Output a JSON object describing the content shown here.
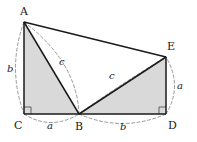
{
  "figure": {
    "kind": "geometry-diagram",
    "canvas": {
      "width": 197,
      "height": 142
    },
    "colors": {
      "background": "#ffffff",
      "stroke": "#1a1a1a",
      "shading": "#d9d9d9",
      "dashed": "#8c8c8c",
      "label": "#1a1a1a"
    }
  },
  "points": {
    "A": {
      "label": "A",
      "x": 24,
      "y": 22,
      "label_x": 20,
      "label_y": 6
    },
    "B": {
      "label": "B",
      "x": 79,
      "y": 114,
      "label_x": 75,
      "label_y": 121
    },
    "C": {
      "label": "C",
      "x": 24,
      "y": 114,
      "label_x": 15,
      "label_y": 120
    },
    "D": {
      "label": "D",
      "x": 166,
      "y": 114,
      "label_x": 168,
      "label_y": 120
    },
    "E": {
      "label": "E",
      "x": 166,
      "y": 57,
      "label_x": 168,
      "label_y": 41
    }
  },
  "solid_segments": [
    {
      "name": "segment-A-E",
      "from": "A",
      "to": "E"
    },
    {
      "name": "segment-A-C",
      "from": "A",
      "to": "C"
    },
    {
      "name": "segment-A-B",
      "from": "A",
      "to": "B"
    },
    {
      "name": "segment-B-E",
      "from": "B",
      "to": "E"
    },
    {
      "name": "segment-E-D",
      "from": "E",
      "to": "D"
    },
    {
      "name": "segment-C-D",
      "from": "C",
      "to": "D"
    }
  ],
  "shaded_triangles": [
    {
      "name": "triangle-A-C-B",
      "vertices": [
        "A",
        "C",
        "B"
      ]
    },
    {
      "name": "triangle-B-D-E",
      "vertices": [
        "B",
        "D",
        "E"
      ]
    }
  ],
  "right_angles": [
    {
      "name": "right-angle-at-C",
      "at": "C",
      "size": 7
    },
    {
      "name": "right-angle-at-D",
      "at": "D",
      "size": 7
    }
  ],
  "dashed_arcs": [
    {
      "name": "arc-A-C",
      "from": "A",
      "to": "C",
      "bulge": "left",
      "label": "b",
      "label_x": 8,
      "label_y": 64
    },
    {
      "name": "arc-C-B",
      "from": "C",
      "to": "B",
      "bulge": "down",
      "label": "a",
      "label_x": 47,
      "label_y": 122
    },
    {
      "name": "arc-B-D",
      "from": "B",
      "to": "D",
      "bulge": "down",
      "label": "b",
      "label_x": 120,
      "label_y": 123
    },
    {
      "name": "arc-D-E",
      "from": "D",
      "to": "E",
      "bulge": "right",
      "label": "a",
      "label_x": 177,
      "label_y": 81
    },
    {
      "name": "arc-A-B",
      "from": "A",
      "to": "B",
      "bulge": "right",
      "label": "c",
      "label_x": 59,
      "label_y": 57
    },
    {
      "name": "arc-B-E",
      "from": "B",
      "to": "E",
      "bulge": "up",
      "label": "c",
      "label_x": 109,
      "label_y": 71
    }
  ],
  "side_labels": [
    {
      "name": "side-label-b-left",
      "text": "b"
    },
    {
      "name": "side-label-a-bottom",
      "text": "a"
    },
    {
      "name": "side-label-b-bottom",
      "text": "b"
    },
    {
      "name": "side-label-a-right",
      "text": "a"
    },
    {
      "name": "side-label-c-left",
      "text": "c"
    },
    {
      "name": "side-label-c-right",
      "text": "c"
    }
  ]
}
